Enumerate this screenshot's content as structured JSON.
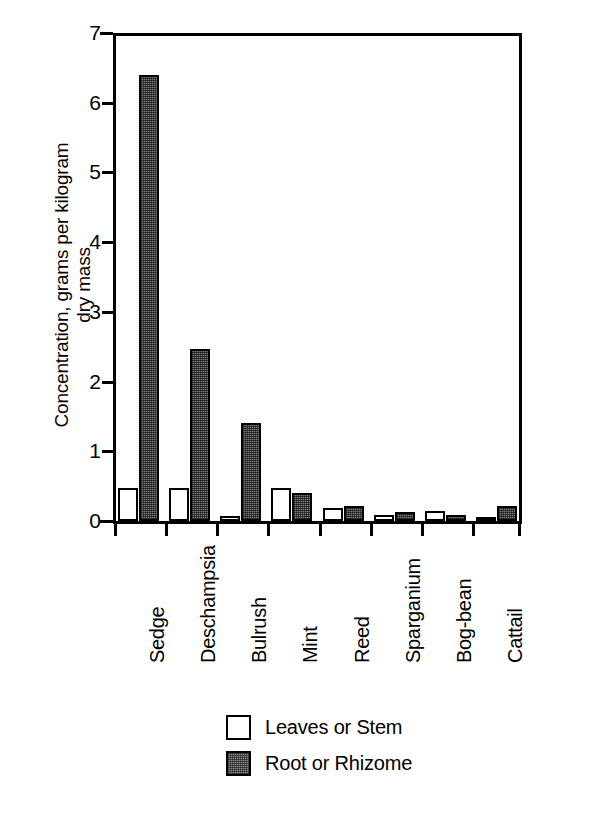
{
  "chart_data": {
    "type": "bar",
    "title": "",
    "xlabel": "",
    "ylabel": "Concentration, grams per kilogram\ndry mass",
    "ylim": [
      0,
      7
    ],
    "yticks": [
      0,
      1,
      2,
      3,
      4,
      5,
      6,
      7
    ],
    "ytick_labels": [
      "0",
      "1",
      "2",
      "3",
      "4",
      "5",
      "6",
      "7"
    ],
    "grid": false,
    "legend_position": "bottom-center",
    "categories": [
      "Sedge",
      "Deschampsia",
      "Bulrush",
      "Mint",
      "Reed",
      "Sparganium",
      "Bog-bean",
      "Cattail"
    ],
    "series": [
      {
        "name": "Leaves or Stem",
        "fill": "white",
        "values": [
          0.47,
          0.47,
          0.07,
          0.47,
          0.18,
          0.09,
          0.14,
          0.04
        ]
      },
      {
        "name": "Root or Rhizome",
        "fill": "gray-stipple",
        "values": [
          6.4,
          2.47,
          1.41,
          0.4,
          0.22,
          0.13,
          0.09,
          0.22
        ]
      }
    ],
    "colors": {
      "axis": "#000000",
      "leaves_fill": "#ffffff",
      "root_fill": "#7a7a7a",
      "outline": "#000000"
    }
  },
  "legend": {
    "items": [
      {
        "label": "Leaves or Stem",
        "swatch": "open-square-icon"
      },
      {
        "label": "Root or Rhizome",
        "swatch": "shaded-square-icon"
      }
    ]
  }
}
